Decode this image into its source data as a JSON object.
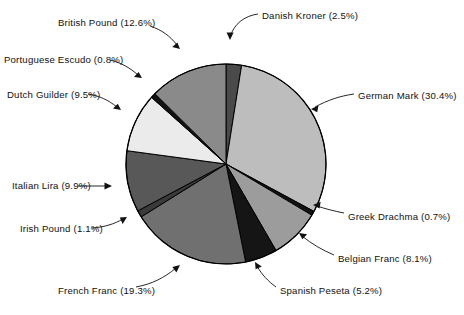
{
  "chart_data": {
    "type": "pie",
    "title": "",
    "subtitle": "",
    "xlabel": "",
    "ylabel": "",
    "units": "percent",
    "legend_position": "none",
    "labels_position": "outside-with-leader-lines",
    "grid": false,
    "start_angle_deg": 0,
    "direction": "clockwise",
    "categories": [
      "Danish Kroner",
      "German Mark",
      "Greek Drachma",
      "Belgian Franc",
      "Spanish Peseta",
      "French Franc",
      "Irish Pound",
      "Italian Lira",
      "Dutch Guilder",
      "Portuguese Escudo",
      "British Pound"
    ],
    "values": [
      2.5,
      30.4,
      0.7,
      8.1,
      5.2,
      19.3,
      1.1,
      9.9,
      9.5,
      0.8,
      12.6
    ],
    "total": 100.1,
    "slices": [
      {
        "name": "Danish Kroner",
        "value": 2.5,
        "label": "Danish Kroner (2.5%)",
        "color": "#4a4a4a"
      },
      {
        "name": "German Mark",
        "value": 30.4,
        "label": "German Mark (30.4%)",
        "color": "#bdbdbd"
      },
      {
        "name": "Greek Drachma",
        "value": 0.7,
        "label": "Greek Drachma (0.7%)",
        "color": "#121212"
      },
      {
        "name": "Belgian Franc",
        "value": 8.1,
        "label": "Belgian Franc (8.1%)",
        "color": "#9c9c9c"
      },
      {
        "name": "Spanish Peseta",
        "value": 5.2,
        "label": "Spanish Peseta (5.2%)",
        "color": "#151515"
      },
      {
        "name": "French Franc",
        "value": 19.3,
        "label": "French Franc (19.3%)",
        "color": "#707070"
      },
      {
        "name": "Irish Pound",
        "value": 1.1,
        "label": "Irish Pound (1.1%)",
        "color": "#3a3a3a"
      },
      {
        "name": "Italian Lira",
        "value": 9.9,
        "label": "Italian Lira (9.9%)",
        "color": "#585858"
      },
      {
        "name": "Dutch Guilder",
        "value": 9.5,
        "label": "Dutch Guilder (9.5%)",
        "color": "#ebebeb"
      },
      {
        "name": "Portuguese Escudo",
        "value": 0.8,
        "label": "Portuguese Escudo (0.8%)",
        "color": "#121212"
      },
      {
        "name": "British Pound",
        "value": 12.6,
        "label": "British Pound (12.6%)",
        "color": "#8a8a8a"
      }
    ],
    "geometry": {
      "cx": 226,
      "cy": 164,
      "r": 100
    },
    "style": {
      "slice_outline": "#000000",
      "background": "#ffffff",
      "text_color": "#111111"
    }
  },
  "labels": {
    "danish_kroner": {
      "text": "Danish Kroner (2.5%)",
      "x": 262,
      "y": 10,
      "align": "right"
    },
    "german_mark": {
      "text": "German Mark (30.4%)",
      "x": 358,
      "y": 90,
      "align": "right"
    },
    "greek_drachma": {
      "text": "Greek Drachma (0.7%)",
      "x": 348,
      "y": 216,
      "align": "right"
    },
    "belgian_franc": {
      "text": "Belgian Franc (8.1%)",
      "x": 338,
      "y": 258,
      "align": "right"
    },
    "spanish_peseta": {
      "text": "Spanish Peseta (5.2%)",
      "x": 280,
      "y": 290,
      "align": "right"
    },
    "french_franc": {
      "text": "French Franc (19.3%)",
      "x": 58,
      "y": 290,
      "align": "left"
    },
    "irish_pound": {
      "text": "Irish Pound (1.1%)",
      "x": 20,
      "y": 229,
      "align": "left"
    },
    "italian_lira": {
      "text": "Italian Lira (9.9%)",
      "x": 12,
      "y": 184,
      "align": "left"
    },
    "dutch_guilder": {
      "text": "Dutch Guilder (9.5%)",
      "x": 7,
      "y": 95,
      "align": "left"
    },
    "portuguese_escudo": {
      "text": "Portuguese Escudo (0.8%)",
      "x": 4,
      "y": 59,
      "align": "left"
    },
    "british_pound": {
      "text": "British Pound (12.6%)",
      "x": 58,
      "y": 22,
      "align": "left"
    }
  }
}
